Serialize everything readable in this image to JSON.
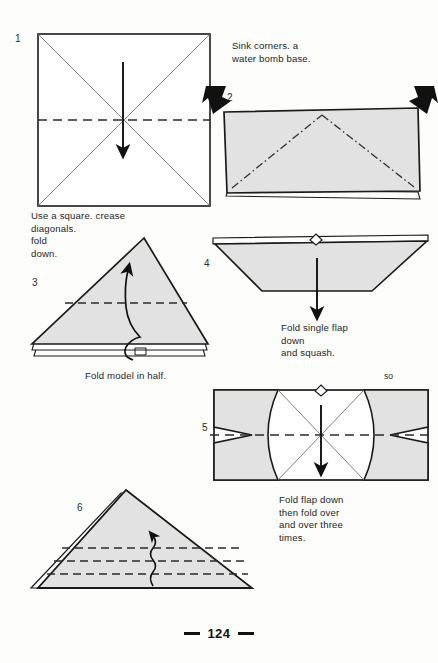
{
  "page": {
    "folio_number": "124",
    "background_color": "#fdfdfc",
    "paper_fill": "#e2e2e2",
    "line_color": "#1a1a1a",
    "crease_color": "#555555"
  },
  "steps": [
    {
      "id": "step-1",
      "number": "1",
      "shape": "square",
      "description": "Square sheet with both diagonals creased and a horizontal valley fold line across the middle; straight arrow points down."
    },
    {
      "id": "step-2",
      "number": "2",
      "shape": "rectangle-folded",
      "description": "Folded rectangle with dash-dot sink lines forming a peak; two solid black arrows push in at the top corners."
    },
    {
      "id": "step-3",
      "number": "3",
      "shape": "triangle",
      "description": "Water bomb base triangle with a horizontal dashed fold line and a curved arrow folding the model in half upward."
    },
    {
      "id": "step-4",
      "number": "4",
      "shape": "trapezoid",
      "description": "Wide trapezoid with a small notch at top centre and a straight arrow pointing down."
    },
    {
      "id": "step-5",
      "number": "5",
      "shape": "bowtie-rectangle",
      "description": "Rectangle containing two shaded bowtie flaps, a horizontal dashed fold line and a straight arrow pointing down."
    },
    {
      "id": "step-6",
      "number": "6",
      "shape": "triangle-pleats",
      "description": "Triangle with three horizontal dashed pleat lines and a wavy repeat arrow pointing up."
    }
  ],
  "captions": [
    {
      "id": "caption-step-1",
      "text": "Use a square. crease\ndiagonals.\nfold\ndown."
    },
    {
      "id": "caption-step-2",
      "text": "Sink corners. a\nwater bomb base."
    },
    {
      "id": "caption-step-3",
      "text": "Fold model in half."
    },
    {
      "id": "caption-step-4",
      "text": "Fold single flap\ndown\nand squash."
    },
    {
      "id": "caption-step-5",
      "text": "so"
    },
    {
      "id": "caption-step-6",
      "text": "Fold flap down\nthen fold over\nand over three\ntimes."
    }
  ],
  "folio": {
    "number": "124"
  }
}
